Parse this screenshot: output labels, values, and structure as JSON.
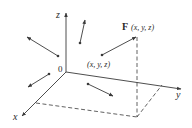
{
  "diagram": {
    "colors": {
      "ink": "#3a3a3a",
      "background": "#ffffff"
    },
    "axes": {
      "origin_label": "0",
      "x_label": "x",
      "y_label": "y",
      "z_label": "z"
    },
    "point_label": "(x, y, z)",
    "vector_label_bold": "F",
    "vector_label_args": "(x, y, z)",
    "sample_vectors": [
      {
        "name": "upper-left",
        "from": [
          58,
          56
        ],
        "to": [
          27,
          37
        ]
      },
      {
        "name": "upper-middle",
        "from": [
          80,
          43
        ],
        "to": [
          85,
          20
        ]
      },
      {
        "name": "lower-left",
        "from": [
          49,
          74
        ],
        "to": [
          28,
          87
        ]
      },
      {
        "name": "floor-middle",
        "from": [
          88,
          84
        ],
        "to": [
          113,
          96
        ]
      },
      {
        "name": "main-F",
        "from": [
          102,
          55
        ],
        "to": [
          136,
          37
        ]
      }
    ]
  }
}
